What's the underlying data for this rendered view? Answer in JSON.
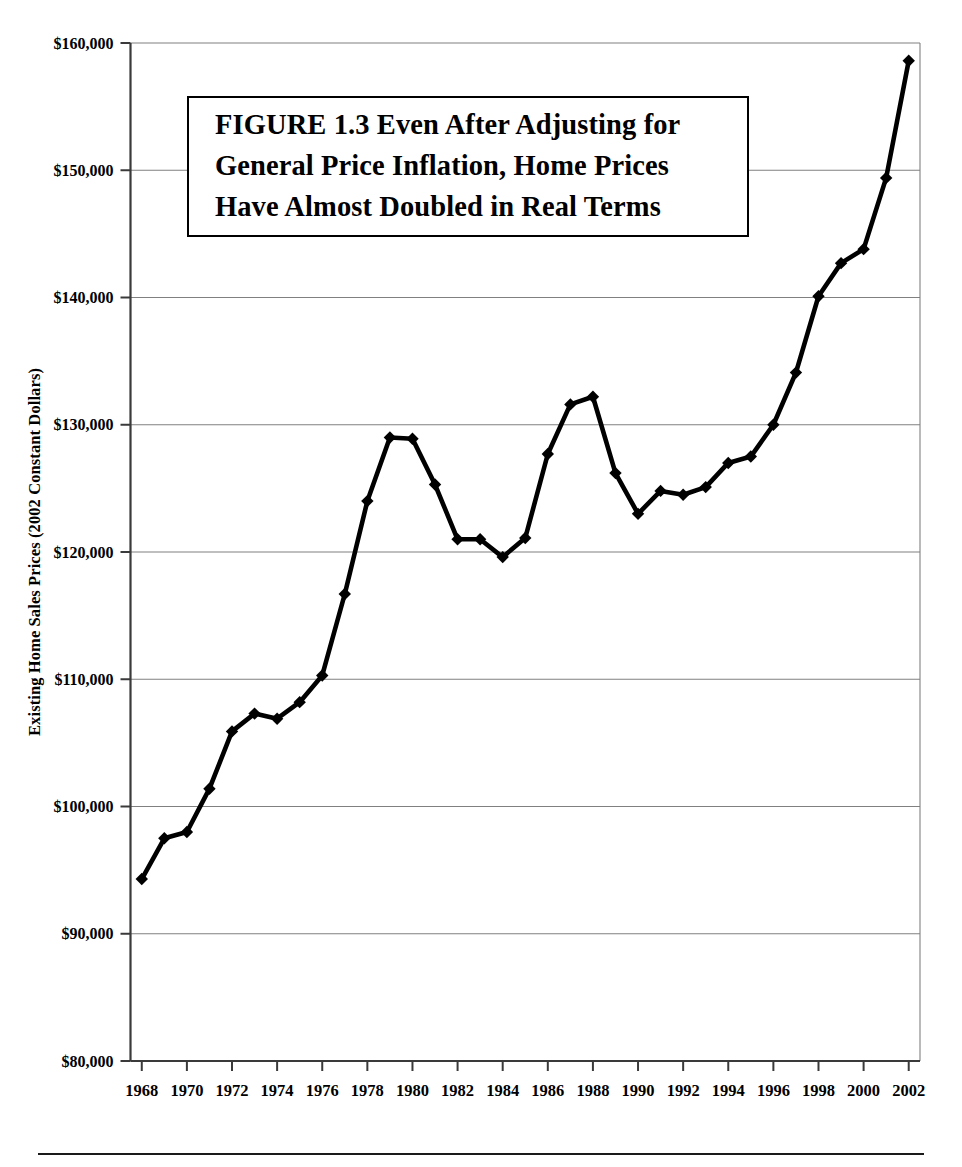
{
  "figure": {
    "title_lines": [
      "FIGURE 1.3  Even After Adjusting for",
      "General Price Inflation, Home Prices",
      "Have Almost Doubled in Real Terms"
    ],
    "title_full": "FIGURE 1.3  Even After Adjusting for General Price Inflation, Home Prices Have Almost Doubled in Real Terms",
    "background_color": "#ffffff",
    "line_color": "#000000",
    "gridline_color": "#808080",
    "axis_color": "#000000",
    "marker_shape": "diamond"
  },
  "chart_data": {
    "type": "line",
    "title": "FIGURE 1.3  Even After Adjusting for General Price Inflation, Home Prices Have Almost Doubled in Real Terms",
    "xlabel": "",
    "ylabel": "Existing Home Sales Prices (2002 Constant Dollars)",
    "xlim": [
      1967.5,
      2002.5
    ],
    "ylim": [
      80000,
      160000
    ],
    "ytick_values": [
      80000,
      90000,
      100000,
      110000,
      120000,
      130000,
      140000,
      150000,
      160000
    ],
    "ytick_labels": [
      "$80,000",
      "$90,000",
      "$100,000",
      "$110,000",
      "$120,000",
      "$130,000",
      "$140,000",
      "$150,000",
      "$160,000"
    ],
    "xtick_values": [
      1968,
      1970,
      1972,
      1974,
      1976,
      1978,
      1980,
      1982,
      1984,
      1986,
      1988,
      1990,
      1992,
      1994,
      1996,
      1998,
      2000,
      2002
    ],
    "xtick_labels": [
      "1968",
      "1970",
      "1972",
      "1974",
      "1976",
      "1978",
      "1980",
      "1982",
      "1984",
      "1986",
      "1988",
      "1990",
      "1992",
      "1994",
      "1996",
      "1998",
      "2000",
      "2002"
    ],
    "grid": "horizontal",
    "legend": "none",
    "x": [
      1968,
      1969,
      1970,
      1971,
      1972,
      1973,
      1974,
      1975,
      1976,
      1977,
      1978,
      1979,
      1980,
      1981,
      1982,
      1983,
      1984,
      1985,
      1986,
      1987,
      1988,
      1989,
      1990,
      1991,
      1992,
      1993,
      1994,
      1995,
      1996,
      1997,
      1998,
      1999,
      2000,
      2001,
      2002
    ],
    "values": [
      94300,
      97500,
      98000,
      101400,
      105900,
      107300,
      106900,
      108200,
      110300,
      116700,
      124000,
      129000,
      128900,
      125300,
      121000,
      121000,
      119600,
      121100,
      127700,
      131600,
      132200,
      126200,
      123000,
      124800,
      124500,
      125100,
      127000,
      127500,
      130000,
      134100,
      140100,
      142700,
      143800,
      149400,
      158600
    ],
    "series": [
      {
        "name": "Existing Home Sales Prices (2002 Constant Dollars)",
        "values": [
          94300,
          97500,
          98000,
          101400,
          105900,
          107300,
          106900,
          108200,
          110300,
          116700,
          124000,
          129000,
          128900,
          125300,
          121000,
          121000,
          119600,
          121100,
          127700,
          131600,
          132200,
          126200,
          123000,
          124800,
          124500,
          125100,
          127000,
          127500,
          130000,
          134100,
          140100,
          142700,
          143800,
          149400,
          158600
        ]
      }
    ]
  }
}
